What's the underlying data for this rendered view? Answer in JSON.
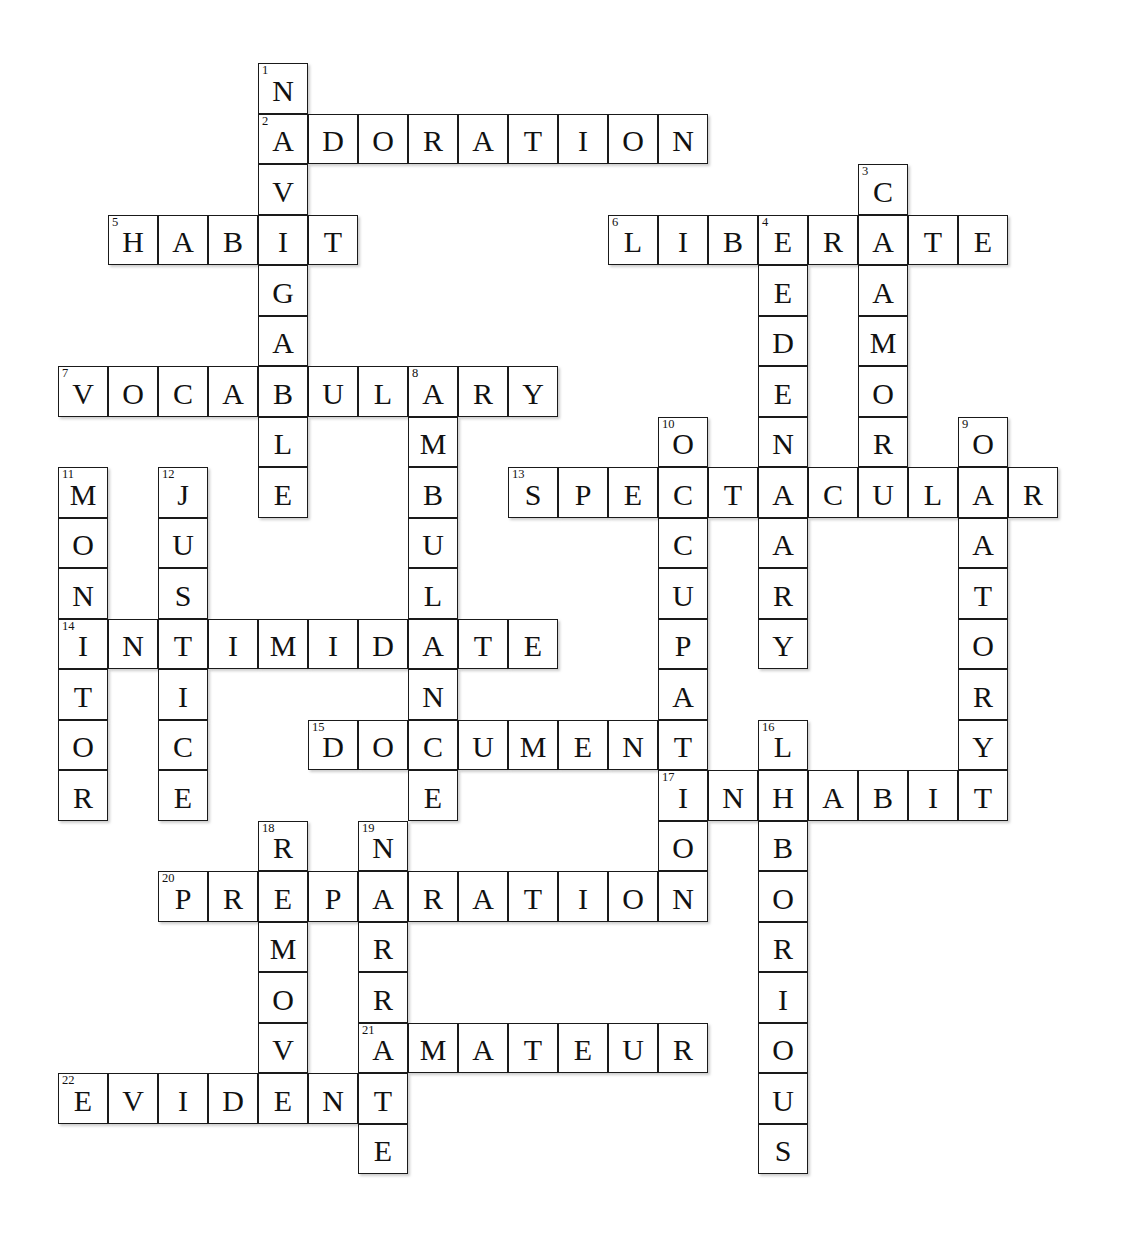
{
  "puzzle": {
    "title": "Crossword Puzzle",
    "grid": {
      "cell_size": 50,
      "cell_height": 50.5,
      "origin_x": 58,
      "origin_y": 63,
      "columns": 21,
      "rows": 23
    },
    "colors": {
      "cell_border": "#1a1a1a",
      "cell_fill": "#ffffff",
      "letter": "#111111",
      "number": "#111111",
      "page_background": "#ffffff"
    },
    "entries": [
      {
        "number": 1,
        "answer": "NAVIGABLE",
        "direction": "down",
        "row": 0,
        "col": 4,
        "length": 9
      },
      {
        "number": 2,
        "answer": "ADORATION",
        "direction": "across",
        "row": 1,
        "col": 4,
        "length": 9
      },
      {
        "number": 3,
        "answer": "CLAMOR",
        "direction": "down",
        "row": 2,
        "col": 16,
        "length": 6
      },
      {
        "number": 4,
        "answer": "SEDENTARY",
        "direction": "down",
        "row": 3,
        "col": 14,
        "length": 9
      },
      {
        "number": 5,
        "answer": "HABIT",
        "direction": "across",
        "row": 3,
        "col": 1,
        "length": 5
      },
      {
        "number": 6,
        "answer": "LIBERATE",
        "direction": "across",
        "row": 3,
        "col": 11,
        "length": 8
      },
      {
        "number": 7,
        "answer": "VOCABULARY",
        "direction": "across",
        "row": 6,
        "col": 0,
        "length": 10
      },
      {
        "number": 8,
        "answer": "AMBULANCE",
        "direction": "down",
        "row": 6,
        "col": 7,
        "length": 9
      },
      {
        "number": 9,
        "answer": "ORATORY",
        "direction": "down",
        "row": 7,
        "col": 18,
        "length": 7
      },
      {
        "number": 10,
        "answer": "OCCUPATION",
        "direction": "down",
        "row": 7,
        "col": 12,
        "length": 10
      },
      {
        "number": 11,
        "answer": "MONITOR",
        "direction": "down",
        "row": 8,
        "col": 0,
        "length": 7
      },
      {
        "number": 12,
        "answer": "JUSTICE",
        "direction": "down",
        "row": 8,
        "col": 2,
        "length": 7
      },
      {
        "number": 13,
        "answer": "SPECTACULAR",
        "direction": "across",
        "row": 8,
        "col": 9,
        "length": 11
      },
      {
        "number": 14,
        "answer": "INTIMIDATE",
        "direction": "across",
        "row": 11,
        "col": 0,
        "length": 10
      },
      {
        "number": 15,
        "answer": "DOCUMENT",
        "direction": "across",
        "row": 13,
        "col": 5,
        "length": 8
      },
      {
        "number": 16,
        "answer": "LABORIOUS",
        "direction": "down",
        "row": 13,
        "col": 14,
        "length": 9
      },
      {
        "number": 17,
        "answer": "INHABIT",
        "direction": "across",
        "row": 14,
        "col": 12,
        "length": 7
      },
      {
        "number": 18,
        "answer": "REMOVE",
        "direction": "down",
        "row": 15,
        "col": 4,
        "length": 6
      },
      {
        "number": 19,
        "answer": "NARRATE",
        "direction": "down",
        "row": 15,
        "col": 6,
        "length": 7
      },
      {
        "number": 20,
        "answer": "PREPARATION",
        "direction": "across",
        "row": 16,
        "col": 2,
        "length": 11
      },
      {
        "number": 21,
        "answer": "AMATEUR",
        "direction": "across",
        "row": 19,
        "col": 6,
        "length": 7
      },
      {
        "number": 22,
        "answer": "EVIDENT",
        "direction": "across",
        "row": 20,
        "col": 0,
        "length": 7
      }
    ]
  }
}
